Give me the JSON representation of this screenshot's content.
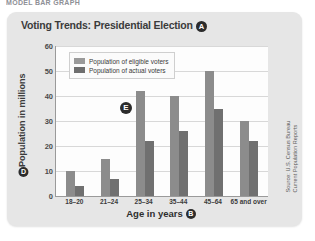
{
  "page_header": "MODEL BAR GRAPH",
  "card": {
    "title": "Voting Trends: Presidential Election",
    "title_marker": "A",
    "source": "Source: U.S. Census Bureau\nCurrent Population Reports",
    "source_line1": "Source: U.S. Census Bureau",
    "source_line2": "Current Population Reports",
    "plot_marker": "E",
    "xaxis_marker": "B",
    "yaxis_marker": "D",
    "colors": {
      "card_background": "#e6e6e6",
      "plot_background": "#fdfdfd",
      "eligible_bar": "#8c8c8c",
      "actual_bar": "#707070",
      "gridline": "#d8d8d8",
      "axis": "#9a9a9a",
      "marker": "#2c2c2c"
    }
  },
  "chart_data": {
    "type": "bar",
    "title": "Voting Trends: Presidential Election",
    "xlabel": "Age in years",
    "ylabel": "Population in millions",
    "categories": [
      "18–20",
      "21–24",
      "25–34",
      "35–44",
      "45–64",
      "65 and over"
    ],
    "series": [
      {
        "name": "Population of eligible voters",
        "values": [
          10,
          15,
          42,
          40,
          50,
          30
        ],
        "color": "#8c8c8c"
      },
      {
        "name": "Population of actual voters",
        "values": [
          4,
          7,
          22,
          26,
          35,
          22
        ],
        "color": "#707070"
      }
    ],
    "ylim": [
      0,
      60
    ],
    "yticks": [
      60,
      50,
      40,
      30,
      20,
      10,
      0
    ],
    "grid": true,
    "legend_position": "top-left-inside"
  }
}
